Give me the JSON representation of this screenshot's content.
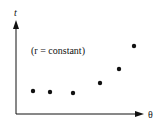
{
  "chart_data": {
    "type": "scatter",
    "title": "",
    "annotation": "(r = constant)",
    "xlabel": "θ",
    "ylabel": "t",
    "grid": false,
    "legend": "none",
    "points": [
      {
        "x": 1,
        "y": 1.0
      },
      {
        "x": 2,
        "y": 0.95
      },
      {
        "x": 3,
        "y": 0.9
      },
      {
        "x": 4,
        "y": 1.4
      },
      {
        "x": 5,
        "y": 2.1
      },
      {
        "x": 6,
        "y": 3.3
      }
    ],
    "pixel_points": [
      [
        33,
        91
      ],
      [
        50,
        92
      ],
      [
        73,
        93
      ],
      [
        100,
        83
      ],
      [
        119,
        69
      ],
      [
        134,
        46
      ]
    ]
  },
  "axes": {
    "x_label": "θ",
    "y_label": "t"
  },
  "annotation": "(r = constant)",
  "colors": {
    "ink": "#111111",
    "background": "#ffffff"
  }
}
